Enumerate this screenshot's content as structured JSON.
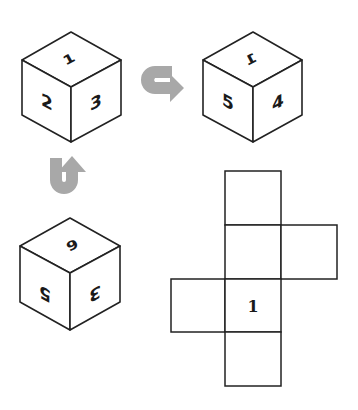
{
  "diagram": {
    "type": "cube-net-puzzle",
    "colors": {
      "line": "#222222",
      "arrow": "#a8a8a8",
      "background": "#ffffff"
    },
    "cubes": [
      {
        "id": "cube-1",
        "faces": {
          "top": "1",
          "left": "2",
          "right": "3"
        }
      },
      {
        "id": "cube-2",
        "faces": {
          "top": "1",
          "left": "5",
          "right": "4"
        }
      },
      {
        "id": "cube-3",
        "faces": {
          "top": "6",
          "left": "5",
          "right": "3"
        }
      }
    ],
    "arrows": [
      {
        "id": "arrow-cube1-to-cube2",
        "icon": "u-turn-arrow-right"
      },
      {
        "id": "arrow-cube3-to-cube1",
        "icon": "u-turn-arrow-up"
      }
    ],
    "net": {
      "cells": [
        "",
        "",
        "",
        "",
        "1",
        ""
      ],
      "labeled_cell": "1"
    }
  }
}
